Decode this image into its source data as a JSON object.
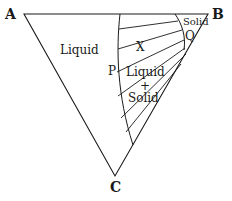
{
  "diagram": {
    "vertices": {
      "a": "A",
      "b": "B",
      "c": "C"
    },
    "regions": {
      "liquid": "Liquid",
      "solid": "Solid",
      "liquid_plus_solid_line1": "Liquid",
      "liquid_plus_solid_line2": "+",
      "liquid_plus_solid_line3": "Solid"
    },
    "points": {
      "p": "P",
      "q": "Q",
      "x": "X"
    },
    "colors": {
      "ink": "#1a1a1a",
      "background": "#ffffff"
    }
  }
}
